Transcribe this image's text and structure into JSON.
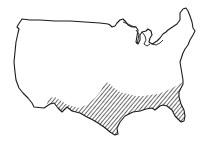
{
  "map": {
    "subject": "Contiguous United States outline",
    "outline_color": "#1a1a1a",
    "background_color": "#ffffff",
    "hatch_color": "#2a2a2a",
    "highlighted_region": {
      "pattern": "diagonal-hatch",
      "description": "Southern United States (Gulf Coast region from southern Arizona/New Mexico through Texas, Louisiana, Mississippi, Alabama, Georgia, Florida and the Carolinas coast)"
    }
  }
}
